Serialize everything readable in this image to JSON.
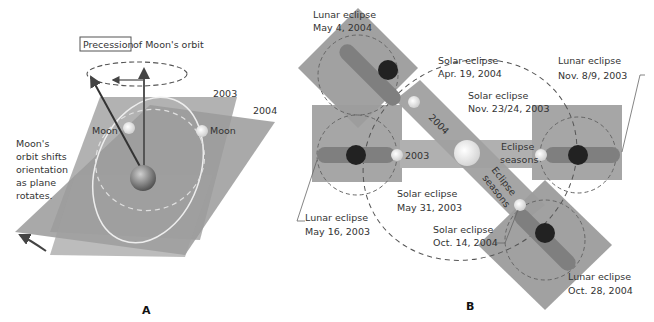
{
  "panel_a": {
    "label": "A",
    "title_boxed": "Precession",
    "title_rest": " of Moon's orbit",
    "plane_2003": "2003",
    "plane_2004": "2004",
    "moon_left": "Moon",
    "moon_right": "Moon",
    "caption": [
      "Moon's",
      "orbit shifts",
      "orientation",
      "as plane",
      "rotates."
    ]
  },
  "panel_b": {
    "label": "B",
    "band_2004": "2004",
    "band_2003": "2003",
    "seasons_h": [
      "Eclipse",
      "seasons"
    ],
    "seasons_d": [
      "Eclipse",
      "seasons"
    ],
    "eclipses": [
      {
        "type": "Lunar eclipse",
        "date": "May 4, 2004"
      },
      {
        "type": "Solar eclipse",
        "date": "Apr. 19, 2004"
      },
      {
        "type": "Lunar eclipse",
        "date": "Nov. 8/9, 2003"
      },
      {
        "type": "Solar eclipse",
        "date": "Nov. 23/24, 2003"
      },
      {
        "type": "Solar eclipse",
        "date": "May 31, 2003"
      },
      {
        "type": "Lunar eclipse",
        "date": "May 16, 2003"
      },
      {
        "type": "Solar eclipse",
        "date": "Oct. 14, 2004"
      },
      {
        "type": "Lunar eclipse",
        "date": "Oct. 28, 2004"
      }
    ]
  },
  "colors": {
    "plane": "#9e9e9e",
    "plane_dark": "#8a8a8a",
    "band": "#a8a8a8",
    "shadow": "#7d7d7d",
    "moon_dark": "#222222",
    "moon_light": "#e6e6e6",
    "line": "#555555"
  }
}
